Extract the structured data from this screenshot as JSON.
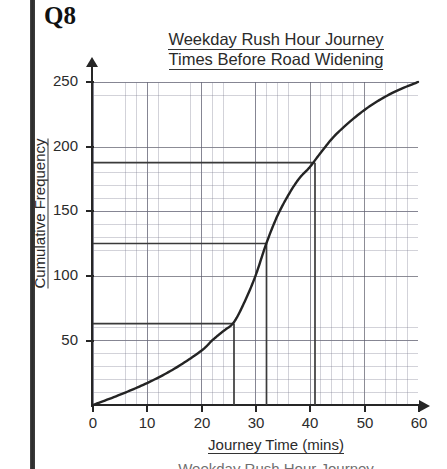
{
  "question": {
    "label": "Q8"
  },
  "chart_title": {
    "line1": "Weekday Rush Hour Journey",
    "line2": "Times Before Road Widening"
  },
  "axes": {
    "x_title": "Journey Time (mins)",
    "y_title": "Cumulative Frequency"
  },
  "caption_partial": "Weekday Rush Hour Journey",
  "chart_data": {
    "type": "line",
    "title": "Weekday Rush Hour Journey Times Before Road Widening",
    "xlabel": "Journey Time (mins)",
    "ylabel": "Cumulative Frequency",
    "xlim": [
      0,
      60
    ],
    "ylim": [
      0,
      250
    ],
    "xticks": [
      0,
      10,
      20,
      30,
      40,
      50,
      60
    ],
    "yticks": [
      50,
      100,
      150,
      200,
      250
    ],
    "grid": true,
    "minor_grid_x": 2,
    "minor_grid_y": 10,
    "legend": "none",
    "series": [
      {
        "name": "Cumulative frequency (before road widening)",
        "x": [
          0,
          5,
          10,
          15,
          20,
          22,
          24,
          26,
          28,
          30,
          32,
          34,
          36,
          38,
          40,
          42,
          45,
          50,
          55,
          60
        ],
        "values": [
          0,
          8,
          17,
          28,
          42,
          50,
          57,
          64,
          80,
          100,
          125,
          146,
          162,
          175,
          184,
          195,
          210,
          228,
          241,
          250
        ]
      }
    ],
    "construction_lines": [
      {
        "name": "lower-quartile-read-off",
        "cf": 63,
        "time": 26,
        "horizontal_from_x": 0,
        "vertical_to_y": 0
      },
      {
        "name": "median-read-off",
        "cf": 125,
        "time": 32,
        "horizontal_from_x": 0,
        "vertical_to_y": 0
      },
      {
        "name": "upper-quartile-read-off",
        "cf": 186,
        "time": 41,
        "horizontal_from_x": 0,
        "vertical_to_y": 0
      }
    ]
  }
}
